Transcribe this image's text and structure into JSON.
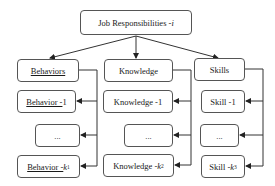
{
  "root": {
    "label": "Job Responsibilities - ",
    "var": "i"
  },
  "categories": [
    {
      "title": "Behaviors",
      "items": [
        {
          "label": "Behavior - ",
          "suffix": "1"
        },
        {
          "label": "..."
        },
        {
          "label": "Behavior - ",
          "var": "k",
          "sub": "1"
        }
      ]
    },
    {
      "title": "Knowledge",
      "items": [
        {
          "label": "Knowledge - ",
          "suffix": "1"
        },
        {
          "label": "..."
        },
        {
          "label": "Knowledge - ",
          "var": "k",
          "sub": "2"
        }
      ]
    },
    {
      "title": "Skills",
      "items": [
        {
          "label": "Skill - ",
          "suffix": "1"
        },
        {
          "label": "..."
        },
        {
          "label": "Skill - ",
          "var": "k",
          "sub": "3"
        }
      ]
    }
  ]
}
